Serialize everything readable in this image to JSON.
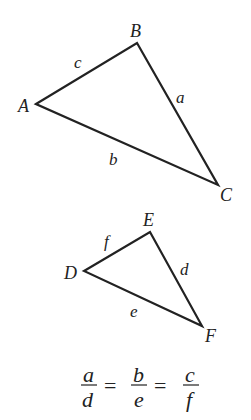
{
  "diagram": {
    "triangle1": {
      "vertices": {
        "A": "A",
        "B": "B",
        "C": "C"
      },
      "sides": {
        "a": "a",
        "b": "b",
        "c": "c"
      }
    },
    "triangle2": {
      "vertices": {
        "D": "D",
        "E": "E",
        "F": "F"
      },
      "sides": {
        "d": "d",
        "e": "e",
        "f": "f"
      }
    },
    "equation": {
      "fractions": [
        {
          "num": "a",
          "den": "d"
        },
        {
          "num": "b",
          "den": "e"
        },
        {
          "num": "c",
          "den": "f"
        }
      ],
      "equals": "="
    },
    "line_color": "#222222"
  }
}
